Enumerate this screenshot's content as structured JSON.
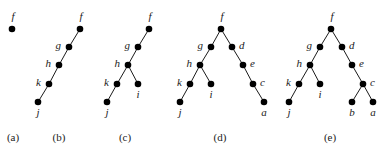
{
  "figure": {
    "colors": {
      "node": "#000000",
      "edge": "#1a1a1a",
      "text": "#222222"
    },
    "panels": [
      {
        "id": "a",
        "caption": "(a)",
        "nodes": [
          {
            "name": "f",
            "parent": null
          }
        ]
      },
      {
        "id": "b",
        "caption": "(b)",
        "nodes": [
          {
            "name": "f",
            "parent": null
          },
          {
            "name": "g",
            "parent": "f"
          },
          {
            "name": "h",
            "parent": "g"
          },
          {
            "name": "k",
            "parent": "h"
          },
          {
            "name": "j",
            "parent": "k"
          }
        ]
      },
      {
        "id": "c",
        "caption": "(c)",
        "nodes": [
          {
            "name": "f",
            "parent": null
          },
          {
            "name": "g",
            "parent": "f"
          },
          {
            "name": "h",
            "parent": "g"
          },
          {
            "name": "k",
            "parent": "h"
          },
          {
            "name": "j",
            "parent": "k"
          },
          {
            "name": "i",
            "parent": "h"
          }
        ]
      },
      {
        "id": "d",
        "caption": "(d)",
        "nodes": [
          {
            "name": "f",
            "parent": null
          },
          {
            "name": "g",
            "parent": "f"
          },
          {
            "name": "h",
            "parent": "g"
          },
          {
            "name": "k",
            "parent": "h"
          },
          {
            "name": "j",
            "parent": "k"
          },
          {
            "name": "i",
            "parent": "h"
          },
          {
            "name": "d",
            "parent": "f"
          },
          {
            "name": "e",
            "parent": "d"
          },
          {
            "name": "c",
            "parent": "e"
          },
          {
            "name": "a",
            "parent": "c"
          }
        ]
      },
      {
        "id": "e",
        "caption": "(e)",
        "nodes": [
          {
            "name": "f",
            "parent": null
          },
          {
            "name": "g",
            "parent": "f"
          },
          {
            "name": "h",
            "parent": "g"
          },
          {
            "name": "k",
            "parent": "h"
          },
          {
            "name": "j",
            "parent": "k"
          },
          {
            "name": "i",
            "parent": "h"
          },
          {
            "name": "d",
            "parent": "f"
          },
          {
            "name": "e",
            "parent": "d"
          },
          {
            "name": "c",
            "parent": "e"
          },
          {
            "name": "b",
            "parent": "c"
          },
          {
            "name": "a",
            "parent": "c"
          }
        ]
      }
    ]
  }
}
